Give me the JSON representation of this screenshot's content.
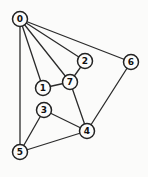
{
  "canvas": {
    "width": 148,
    "height": 177,
    "background": "#fbfbfa"
  },
  "style": {
    "edge_color": "#2b2b2b",
    "edge_width": 1.3,
    "node_fill": "#fcfcfb",
    "node_stroke": "#222222",
    "node_stroke_width": 1.5,
    "node_radius": 7.5,
    "label_color": "#111111",
    "label_font_size": 9
  },
  "graph": {
    "type": "undirected-graph",
    "node_count": 8,
    "edge_count": 12,
    "nodes": [
      {
        "id": "0",
        "label": "0",
        "x": 20,
        "y": 19
      },
      {
        "id": "1",
        "label": "1",
        "x": 43,
        "y": 88
      },
      {
        "id": "2",
        "label": "2",
        "x": 85,
        "y": 61
      },
      {
        "id": "3",
        "label": "3",
        "x": 44,
        "y": 110
      },
      {
        "id": "4",
        "label": "4",
        "x": 87,
        "y": 131
      },
      {
        "id": "5",
        "label": "5",
        "x": 20,
        "y": 152
      },
      {
        "id": "6",
        "label": "6",
        "x": 131,
        "y": 62
      },
      {
        "id": "7",
        "label": "7",
        "x": 70,
        "y": 82
      }
    ],
    "edges": [
      [
        "0",
        "1"
      ],
      [
        "0",
        "2"
      ],
      [
        "0",
        "5"
      ],
      [
        "0",
        "6"
      ],
      [
        "0",
        "7"
      ],
      [
        "1",
        "7"
      ],
      [
        "2",
        "7"
      ],
      [
        "3",
        "4"
      ],
      [
        "3",
        "5"
      ],
      [
        "4",
        "5"
      ],
      [
        "4",
        "6"
      ],
      [
        "4",
        "7"
      ]
    ]
  }
}
